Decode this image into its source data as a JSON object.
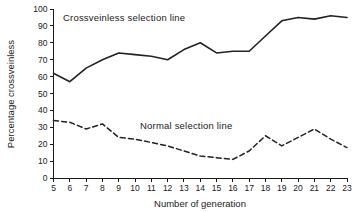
{
  "chart_data": {
    "type": "line",
    "title": "",
    "xlabel": "Number of generation",
    "ylabel": "Percentage crossveinless",
    "xlim": [
      5,
      23
    ],
    "ylim": [
      0,
      100
    ],
    "grid": false,
    "legend_position": "inline-annotation",
    "x": [
      5,
      6,
      7,
      8,
      9,
      10,
      11,
      12,
      13,
      14,
      15,
      16,
      17,
      18,
      19,
      20,
      21,
      22,
      23
    ],
    "xticks": [
      "5",
      "6",
      "7",
      "8",
      "9",
      "10",
      "11",
      "12",
      "13",
      "14",
      "15",
      "16",
      "17",
      "18",
      "19",
      "20",
      "21",
      "22",
      "23"
    ],
    "yticks": [
      "0",
      "10",
      "20",
      "30",
      "40",
      "50",
      "60",
      "70",
      "80",
      "90",
      "100"
    ],
    "series": [
      {
        "name": "Crossveinless selection line",
        "style": "solid",
        "annotation": "Crossveinless selection line",
        "values": [
          62,
          57,
          65,
          70,
          74,
          73,
          72,
          70,
          76,
          80,
          74,
          75,
          75,
          84,
          93,
          95,
          94,
          96,
          95
        ]
      },
      {
        "name": "Normal selection line",
        "style": "dashed",
        "annotation": "Normal selection line",
        "values": [
          34,
          33,
          29,
          32,
          24,
          23,
          21,
          19,
          16,
          13,
          12,
          11,
          16,
          25,
          19,
          24,
          29,
          23,
          18
        ]
      }
    ]
  },
  "annotations": {
    "crossveinless_label": "Crossveinless selection line",
    "normal_label": "Normal selection line"
  },
  "axes": {
    "x_title": "Number of generation",
    "y_title": "Percentage crossveinless"
  }
}
